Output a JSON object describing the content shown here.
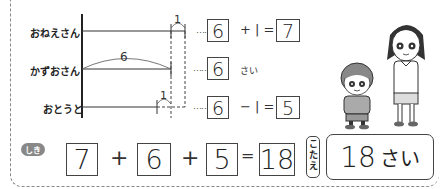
{
  "diagram": {
    "rows": [
      {
        "label": "おねえさん",
        "value": "6",
        "op_text": "+ | =",
        "result": "7"
      },
      {
        "label": "かずおさん",
        "value": "6",
        "unit": "さい"
      },
      {
        "label": "おとうと",
        "value": "6",
        "op_text": "− | =",
        "result": "5"
      }
    ],
    "arc_label_kazuo": "6",
    "diff_label_top": "1",
    "diff_label_bottom": "1",
    "leader_dots": "……"
  },
  "equation": {
    "badge": "しき",
    "terms": [
      "7",
      "6",
      "5"
    ],
    "operators": [
      "+",
      "+"
    ],
    "equals": "=",
    "result": "18"
  },
  "answer": {
    "badge": "こたえ",
    "badge_chars": [
      "こ",
      "た",
      "え"
    ],
    "value": "18",
    "unit": "さい"
  },
  "illustration": {
    "description": "boy and older girl standing side by side"
  }
}
